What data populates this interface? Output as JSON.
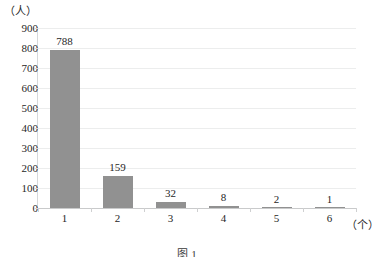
{
  "chart_data": {
    "type": "bar",
    "title": "",
    "categories": [
      "1",
      "2",
      "3",
      "4",
      "5",
      "6"
    ],
    "values": [
      788,
      159,
      32,
      8,
      2,
      1
    ],
    "data_labels": [
      "788",
      "159",
      "32",
      "8",
      "2",
      "1"
    ],
    "xlabel": "（个）",
    "ylabel": "（人）",
    "ylim": [
      0,
      900
    ],
    "ytick_step": 100,
    "ytick_labels": [
      "0",
      "100",
      "200",
      "300",
      "400",
      "500",
      "600",
      "700",
      "800",
      "900"
    ],
    "grid": true,
    "legend": "none",
    "series_color": "#919191",
    "gridline_color": "#eceded",
    "axis_color": "#d7d8d9"
  },
  "caption": {
    "text": "图 1　　　　　　　　　　　　"
  }
}
